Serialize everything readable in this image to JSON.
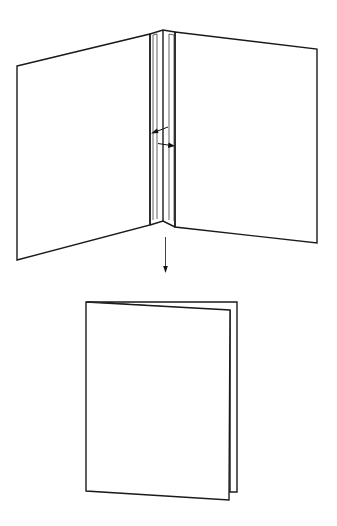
{
  "diagram": {
    "title": "Booklet folding: open spread with glue gutters folds into closed booklet",
    "stroke_color": "#1a1a1a",
    "background_color": "#ffffff",
    "steps": [
      {
        "name": "open-spread",
        "description": "Open two-page spread with central spine and glue strips",
        "parts": [
          "left-page",
          "spine",
          "left-gutter-strip",
          "right-gutter-strip",
          "right-page"
        ],
        "arrows": [
          {
            "name": "arrow-to-left-page",
            "direction": "left"
          },
          {
            "name": "arrow-to-right-page",
            "direction": "right"
          }
        ]
      },
      {
        "name": "fold-transition",
        "description": "Downward arrow indicating folding step",
        "direction": "down"
      },
      {
        "name": "closed-booklet",
        "description": "Folded booklet with front cover and back page edge visible",
        "parts": [
          "front-cover",
          "back-page-edge"
        ]
      }
    ]
  }
}
